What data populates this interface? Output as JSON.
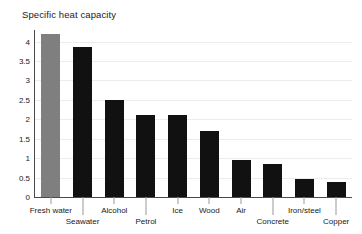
{
  "chart_data": {
    "type": "bar",
    "title": "Specific heat capacity",
    "xlabel": "",
    "ylabel": "",
    "ylim": [
      0,
      4.4
    ],
    "yticks": [
      "0",
      "0.5",
      "1",
      "1.5",
      "2",
      "2.5",
      "3",
      "3.5",
      "4"
    ],
    "ytick_values": [
      0,
      0.5,
      1,
      1.5,
      2,
      2.5,
      3,
      3.5,
      4
    ],
    "grid": true,
    "legend": "none",
    "categories": [
      "Fresh water",
      "Seawater",
      "Alcohol",
      "Petrol",
      "Ice",
      "Wood",
      "Air",
      "Concrete",
      "Iron/steel",
      "Copper"
    ],
    "values": [
      4.2,
      3.85,
      2.5,
      2.1,
      2.1,
      1.7,
      0.95,
      0.85,
      0.47,
      0.38
    ],
    "highlight_index": 0,
    "colors": {
      "bar": "#111111",
      "highlight_bar": "#7f7f7f",
      "axis": "#4a4a4a",
      "gridline": "#ececec",
      "text": "#1a1a1a",
      "background": "#ffffff"
    },
    "label_rows": [
      0,
      1,
      0,
      1,
      0,
      0,
      0,
      1,
      0,
      1
    ]
  }
}
